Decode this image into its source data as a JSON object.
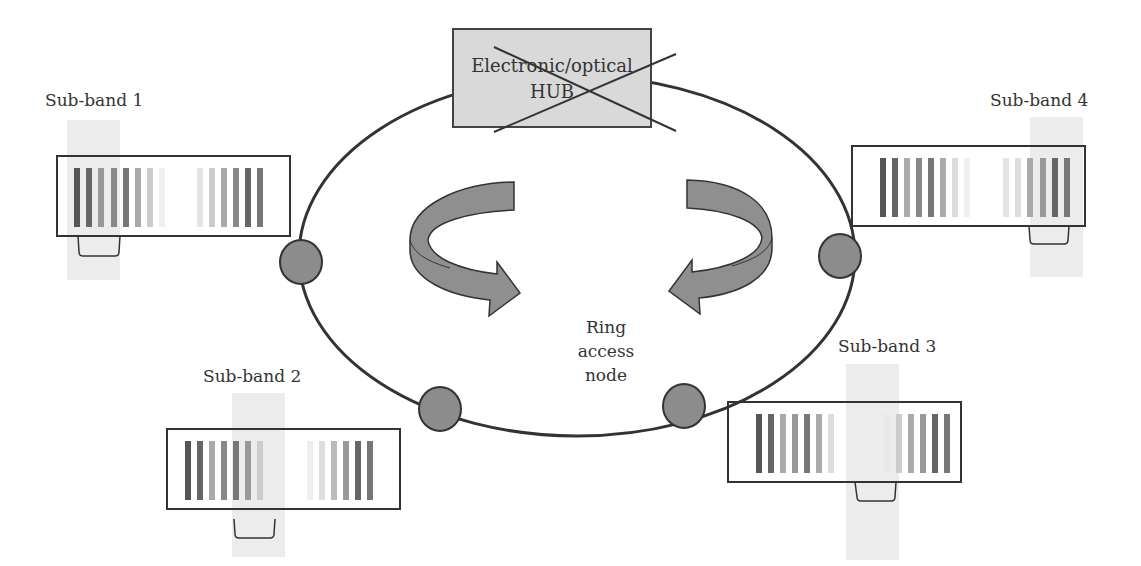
{
  "diagram": {
    "type": "ring-network",
    "hub": {
      "line1": "Electronic/optical",
      "line2": "HUB",
      "crossed_out": true,
      "fill": "#d9d9d9"
    },
    "ring": {
      "stroke": "#333333"
    },
    "node_label": {
      "line1": "Ring",
      "line2": "access",
      "line3": "node"
    },
    "node_fill": "#8c8c8c",
    "arrow_fill": "#8f8f8f",
    "subbands": [
      {
        "label": "Sub-band 1"
      },
      {
        "label": "Sub-band 2"
      },
      {
        "label": "Sub-band 3"
      },
      {
        "label": "Sub-band 4"
      }
    ]
  }
}
